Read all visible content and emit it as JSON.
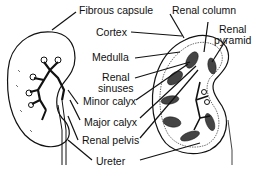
{
  "diagram": {
    "labels": {
      "fibrous_capsule": "Fibrous capsule",
      "renal_column": "Renal column",
      "cortex": "Cortex",
      "renal_pyramid_line1": "Renal",
      "renal_pyramid_line2": "pyramid",
      "medulla": "Medulla",
      "renal_sinuses_line1": "Renal",
      "renal_sinuses_line2": "sinuses",
      "minor_calyx": "Minor calyx",
      "major_calyx": "Major calyx",
      "renal_pelvis": "Renal pelvis",
      "ureter": "Ureter"
    },
    "colors": {
      "ink": "#111111",
      "background": "#ffffff"
    }
  }
}
